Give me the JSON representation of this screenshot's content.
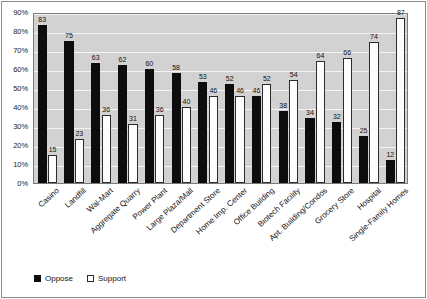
{
  "chart_data": {
    "type": "bar",
    "title": "",
    "subtitle": "",
    "xlabel": "",
    "ylabel": "",
    "ylim": [
      0,
      90
    ],
    "ytick_labels": [
      "0%",
      "10%",
      "20%",
      "30%",
      "40%",
      "50%",
      "60%",
      "70%",
      "80%",
      "90%"
    ],
    "ytick_values": [
      0,
      10,
      20,
      30,
      40,
      50,
      60,
      70,
      80,
      90
    ],
    "grid": true,
    "legend_position": "bottom-left",
    "categories": [
      "Casino",
      "Landfill",
      "Wal-Mart",
      "Aggregate Quarry",
      "Power Plant",
      "Large Plaza/Mall",
      "Department Store",
      "Home Imp. Center",
      "Office Building",
      "Biotech Facility",
      "Apt. Building/Condos",
      "Grocery Store",
      "Hospital",
      "Single-Family Homes"
    ],
    "series": [
      {
        "name": "Oppose",
        "color": "#0d0d0d",
        "values": [
          83,
          75,
          63,
          62,
          60,
          58,
          53,
          52,
          46,
          38,
          34,
          32,
          25,
          12
        ]
      },
      {
        "name": "Support",
        "color": "#ffffff",
        "values": [
          15,
          23,
          36,
          31,
          36,
          40,
          46,
          46,
          52,
          54,
          64,
          66,
          74,
          87
        ]
      }
    ]
  },
  "legend": {
    "items": [
      {
        "label": "Oppose",
        "swatch": "filled-square-icon"
      },
      {
        "label": "Support",
        "swatch": "hollow-square-icon"
      }
    ]
  },
  "colors": {
    "plot_background": "#d2d2d2",
    "gridline": "#f4f4f4",
    "axis_border": "#7a7a7a",
    "figure_border": "#8c8c8c",
    "oppose": "#0d0d0d",
    "support": "#ffffff",
    "text": "#141414"
  }
}
